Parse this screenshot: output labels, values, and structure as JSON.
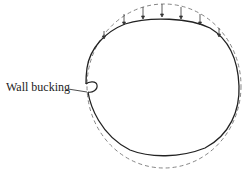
{
  "diagram": {
    "title": "",
    "labels": {
      "wall_buckling": "Wall bucking"
    },
    "elements": {
      "original_shape": "dashed circle (undeformed wall)",
      "deformed_shape": "solid oval (flattened top under load)",
      "load_arrows": 9
    },
    "colors": {
      "line": "#222222",
      "dashed": "#777777",
      "background": "#ffffff"
    }
  }
}
